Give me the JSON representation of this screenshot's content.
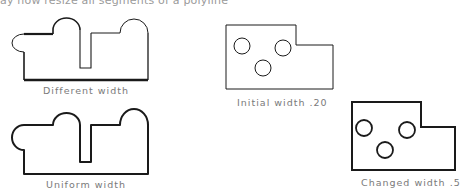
{
  "header": {
    "partial_text": "ay now resize all segments of a polyline"
  },
  "figures": [
    {
      "id": "different-width",
      "caption": "Different width"
    },
    {
      "id": "uniform-width",
      "caption": "Uniform width"
    },
    {
      "id": "initial-width",
      "caption": "Initial width .20"
    },
    {
      "id": "changed-width",
      "caption": "Changed width .5"
    }
  ],
  "colors": {
    "stroke": "#1a1a1a",
    "caption": "#7a7a7a",
    "background": "#ffffff"
  }
}
